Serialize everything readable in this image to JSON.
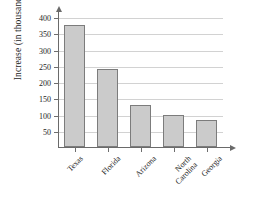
{
  "chart_data": {
    "type": "bar",
    "title": "",
    "subtitle": "",
    "xlabel": "",
    "ylabel": "Increase (in thousands)",
    "categories": [
      "Texas",
      "Florida",
      "Arizona",
      "North Carolina",
      "Georgia"
    ],
    "values": [
      375,
      240,
      130,
      100,
      82
    ],
    "ylim": [
      0,
      400
    ],
    "yticks": [
      50,
      100,
      150,
      200,
      250,
      300,
      350,
      400
    ],
    "ytick_labels": [
      "50",
      "100",
      "150",
      "200",
      "250",
      "300",
      "350",
      "400"
    ],
    "grid": "horizontal",
    "legend": "none",
    "bar_color": "#cbcbcb",
    "bar_border_color": "#7c7c7c",
    "gridline_color": "#d2d2d2",
    "axis_color": "#6a6a6a",
    "axis_arrows": true,
    "xtick_label_rotation": -45,
    "series": [
      {
        "name": "Increase",
        "values": [
          375,
          240,
          130,
          100,
          82
        ]
      }
    ]
  },
  "axis": {
    "y_title": "Increase (in thousands)"
  },
  "x_labels": [
    {
      "text": "Texas"
    },
    {
      "text": "Florida"
    },
    {
      "text": "Arizona"
    },
    {
      "text": "North\nCarolina"
    },
    {
      "text": "Georgia"
    }
  ]
}
